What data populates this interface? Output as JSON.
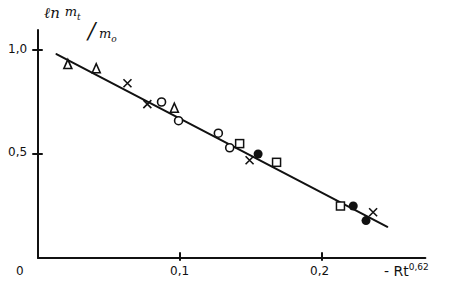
{
  "chart_data": {
    "type": "scatter",
    "title": "",
    "ylabel": "ln m_t/m_o",
    "ylabel_parts": {
      "ln": "ℓn",
      "num": "m",
      "num_sub": "t",
      "den": "m",
      "den_sub": "o"
    },
    "xlabel": "-Rt^0.62",
    "xlabel_parts": {
      "base": "- Rt",
      "exp": "0,62"
    },
    "xlim": [
      0,
      0.27
    ],
    "ylim": [
      0,
      1.1
    ],
    "x_ticks": [
      {
        "value": 0.1,
        "label": "0,1"
      },
      {
        "value": 0.2,
        "label": "0,2"
      }
    ],
    "y_ticks": [
      {
        "value": 0.5,
        "label": "0,5"
      },
      {
        "value": 1.0,
        "label": "1,0"
      }
    ],
    "origin_label": "0",
    "grid": false,
    "legend": null,
    "series": [
      {
        "name": "triangle",
        "marker": "triangle-open",
        "points": [
          [
            0.021,
            0.93
          ],
          [
            0.041,
            0.91
          ],
          [
            0.096,
            0.72
          ]
        ]
      },
      {
        "name": "cross",
        "marker": "x",
        "points": [
          [
            0.063,
            0.84
          ],
          [
            0.077,
            0.74
          ],
          [
            0.149,
            0.47
          ],
          [
            0.236,
            0.22
          ]
        ]
      },
      {
        "name": "circle-open",
        "marker": "circle-open",
        "points": [
          [
            0.087,
            0.75
          ],
          [
            0.099,
            0.66
          ],
          [
            0.127,
            0.6
          ],
          [
            0.135,
            0.53
          ]
        ]
      },
      {
        "name": "square",
        "marker": "square-open",
        "points": [
          [
            0.142,
            0.55
          ],
          [
            0.168,
            0.46
          ],
          [
            0.213,
            0.25
          ]
        ]
      },
      {
        "name": "circle-filled",
        "marker": "circle-filled",
        "points": [
          [
            0.155,
            0.5
          ],
          [
            0.222,
            0.25
          ],
          [
            0.231,
            0.18
          ]
        ]
      }
    ],
    "fit_line": {
      "x": [
        0.013,
        0.246
      ],
      "y": [
        0.98,
        0.15
      ]
    }
  }
}
